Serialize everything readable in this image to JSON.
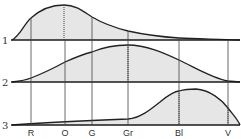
{
  "figure": {
    "row_labels": [
      "1",
      "2",
      "3"
    ],
    "band_labels": [
      "R",
      "O",
      "G",
      "Gr",
      "Bl",
      "V"
    ],
    "colors": {
      "fill": "#e6e6e6",
      "line": "#222222",
      "text": "#333333"
    }
  },
  "diagram": {
    "type": "spectral-distribution-curves",
    "axis": {
      "categories": [
        "R",
        "O",
        "G",
        "Gr",
        "Bl",
        "V"
      ],
      "note": "Color bands from red to violet along the horizontal axis"
    },
    "curves": [
      {
        "id": "1",
        "peak_near": "O",
        "shape": "peak at orange, long tail declining toward violet"
      },
      {
        "id": "2",
        "peak_near": "Gr",
        "shape": "broad symmetric hump centered near Gr"
      },
      {
        "id": "3",
        "peak_near": "Bl",
        "shape": "low through red-green, rises to peak between Bl and V, falls at V"
      }
    ]
  }
}
